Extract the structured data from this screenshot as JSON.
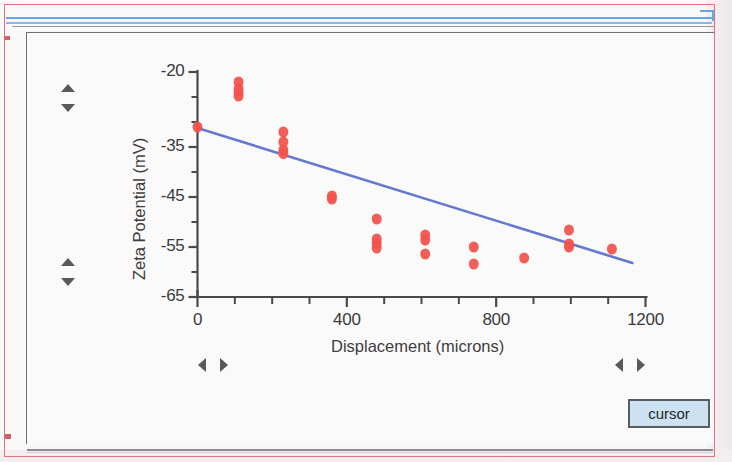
{
  "window": {
    "accent_border_color": "#e2737b",
    "rule_color_blue": "#6aa8e0",
    "panel_border_color": "#6f6f75"
  },
  "controls": {
    "cursor_button_label": "cursor",
    "cursor_button_color": "#cfe4f4",
    "spinner_vertical_top": {
      "up": "▲",
      "down": "▼"
    },
    "spinner_vertical_bottom": {
      "up": "▲",
      "down": "▼"
    },
    "spinner_horizontal_left": {
      "left": "◀",
      "right": "▶"
    },
    "spinner_horizontal_right": {
      "left": "◀",
      "right": "▶"
    }
  },
  "chart_data": {
    "type": "scatter",
    "title": "",
    "subtitle": "",
    "xlabel": "Displacement (microns)",
    "ylabel": "Zeta Potential (mV)",
    "xlim": [
      0,
      1200
    ],
    "ylim": [
      -65,
      -20
    ],
    "xticks": [
      0,
      400,
      800,
      1200
    ],
    "xtick_labels": [
      "0",
      "400",
      "800",
      "1200"
    ],
    "xminor_step": 100,
    "yticks": [
      -20,
      -25,
      -30,
      -35,
      -40,
      -45,
      -50,
      -55,
      -60,
      -65
    ],
    "ytick_labels_shown": [
      "-20",
      "-35",
      "-45",
      "-55",
      "-65"
    ],
    "ylabeled_ticks": [
      -20,
      -35,
      -45,
      -55,
      -65
    ],
    "grid": false,
    "legend": false,
    "marker_color": "#f4544c",
    "line_color": "#5a6fd0",
    "series": [
      {
        "name": "Zeta Potential measurements",
        "marker": "circle",
        "color": "#f4544c",
        "points": [
          {
            "x": 0,
            "y": -31.0
          },
          {
            "x": 110,
            "y": -22.0
          },
          {
            "x": 110,
            "y": -23.4
          },
          {
            "x": 110,
            "y": -24.2
          },
          {
            "x": 110,
            "y": -24.8
          },
          {
            "x": 230,
            "y": -32.0
          },
          {
            "x": 230,
            "y": -34.0
          },
          {
            "x": 230,
            "y": -35.6
          },
          {
            "x": 230,
            "y": -36.3
          },
          {
            "x": 360,
            "y": -44.8
          },
          {
            "x": 360,
            "y": -45.4
          },
          {
            "x": 480,
            "y": -49.4
          },
          {
            "x": 480,
            "y": -53.4
          },
          {
            "x": 480,
            "y": -54.3
          },
          {
            "x": 480,
            "y": -55.2
          },
          {
            "x": 610,
            "y": -52.6
          },
          {
            "x": 610,
            "y": -53.6
          },
          {
            "x": 610,
            "y": -56.4
          },
          {
            "x": 740,
            "y": -55.0
          },
          {
            "x": 740,
            "y": -58.4
          },
          {
            "x": 875,
            "y": -57.2
          },
          {
            "x": 995,
            "y": -51.6
          },
          {
            "x": 995,
            "y": -54.4
          },
          {
            "x": 995,
            "y": -55.0
          },
          {
            "x": 1110,
            "y": -55.4
          }
        ]
      }
    ],
    "trendline": {
      "name": "linear fit",
      "color": "#5a6fd0",
      "x_start": 0,
      "y_start": -31.2,
      "x_end": 1165,
      "y_end": -58.2
    }
  }
}
